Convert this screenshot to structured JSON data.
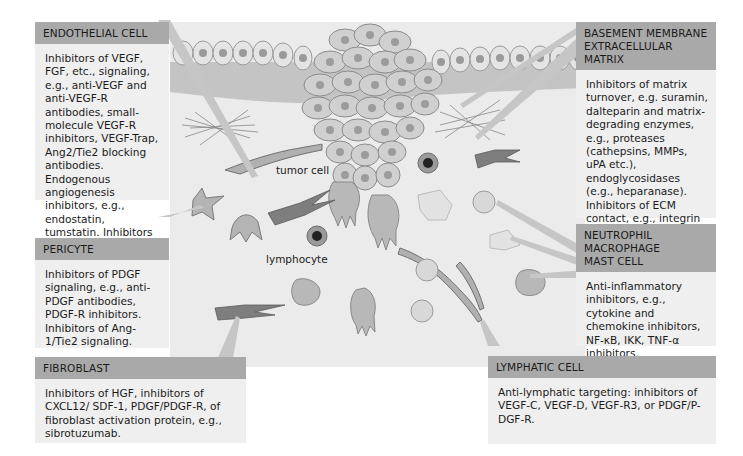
{
  "colors": {
    "header_bg": "#a9a9a9",
    "box_bg": "#efefef",
    "stroma_bg": "#eaeaea",
    "membrane": "#c2c2c2",
    "cell_fill": "#d4d4d4",
    "cell_nucleus": "#9a9a9a",
    "dark_cell": "#7a7a7a"
  },
  "boxes": {
    "endothelial": {
      "title": "ENDOTHELIAL CELL",
      "text": "Inhibitors of VEGF, FGF, etc., signaling, e.g., anti-VEGF and anti-VEGF-R antibodies, small-molecule VEGF-R inhibitors, VEGF-Trap, Ang2/Tie2 blocking antibodies. Endogenous angiogenesis inhibitors, e.g., endostatin, tumstatin. Inhibitors of EPC recruitment."
    },
    "pericyte": {
      "title": "PERICYTE",
      "text": "Inhibitors of PDGF signaling, e.g., anti-PDGF antibodies, PDGF-R inhibitors. Inhibitors of Ang-1/Tie2 signaling."
    },
    "fibroblast": {
      "title": "FIBROBLAST",
      "text": "Inhibitors of HGF, inhibitors of CXCL12/ SDF-1, PDGF/PDGF-R, of fibroblast activation protein, e.g., sibrotuzumab."
    },
    "basement": {
      "title_line1": "BASEMENT MEMBRANE",
      "title_line2": "EXTRACELLULAR MATRIX",
      "text": "Inhibitors of matrix turnover, e.g. suramin, dalteparin and matrix-degrading enzymes, e.g., proteases (cathepsins, MMPs, uPA etc.), endoglycosidases (e.g., heparanase). Inhibitors of ECM contact, e.g., integrin αvβ3, αvβ5, α5β1, or α6β4 antibodies."
    },
    "immune": {
      "title_line1": "NEUTROPHIL",
      "title_line2": "MACROPHAGE",
      "title_line3": "MAST CELL",
      "text": "Anti-inflammatory inhibitors, e.g., cytokine and chemokine inhibitors, NF-κB, IKK, TNF-α inhibitors."
    },
    "lymphatic": {
      "title": "LYMPHATIC CELL",
      "text": "Anti-lymphatic targeting:  inhibitors of VEGF-C, VEGF-D, VEGF-R3, or PDGF/P-DGF-R."
    }
  },
  "labels": {
    "tumor_cell": "tumor cell",
    "lymphocyte": "lymphocyte"
  }
}
